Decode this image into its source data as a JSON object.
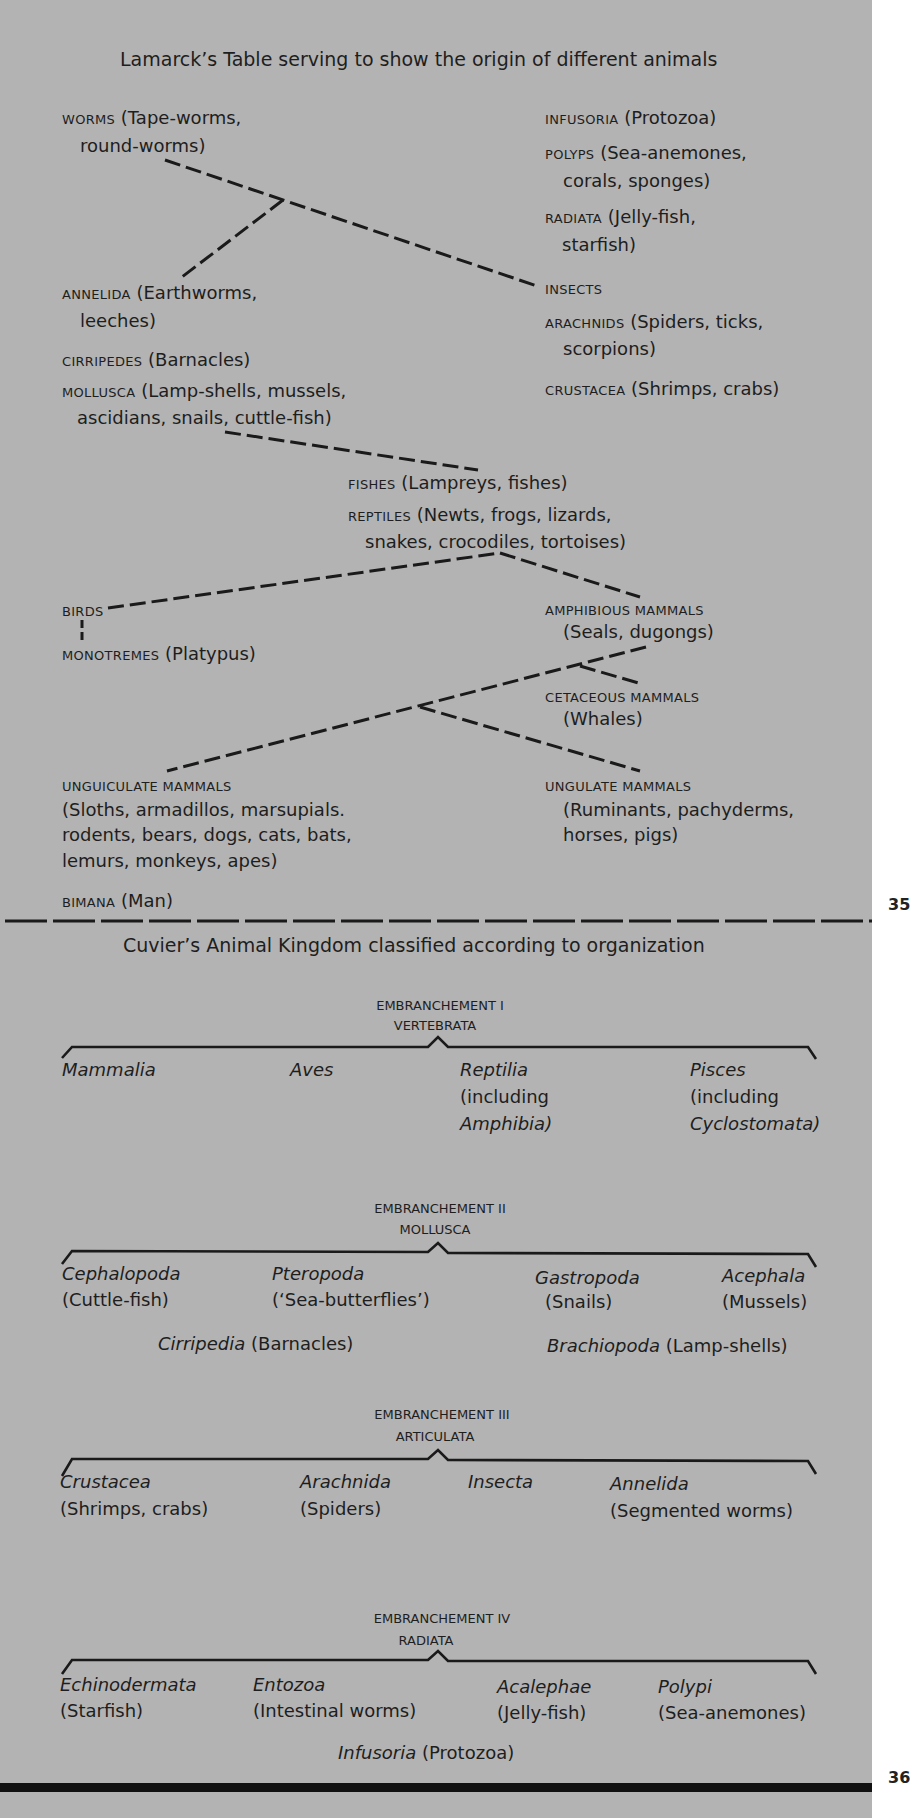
{
  "lamarck": {
    "title": "Lamarck’s Table serving to show the origin of different animals",
    "left_column": [
      {
        "group": "WORMS",
        "desc": "(Tape-worms,",
        "desc2": "round-worms)"
      },
      {
        "group": "ANNELIDA",
        "desc": "(Earthworms,",
        "desc2": "leeches)"
      },
      {
        "group": "CIRRIPEDES",
        "desc": "(Barnacles)"
      },
      {
        "group": "MOLLUSCA",
        "desc": "(Lamp-shells, mussels,",
        "desc2": "ascidians, snails, cuttle-fish)"
      }
    ],
    "right_column": [
      {
        "group": "INFUSORIA",
        "desc": "(Protozoa)"
      },
      {
        "group": "POLYPS",
        "desc": "(Sea-anemones,",
        "desc2": "corals, sponges)"
      },
      {
        "group": "RADIATA",
        "desc": "(Jelly-fish,",
        "desc2": "starfish)"
      },
      {
        "group": "INSECTS"
      },
      {
        "group": "ARACHNIDS",
        "desc": "(Spiders, ticks,",
        "desc2": "scorpions)"
      },
      {
        "group": "CRUSTACEA",
        "desc": "(Shrimps, crabs)"
      }
    ],
    "center": [
      {
        "group": "FISHES",
        "desc": "(Lampreys, fishes)"
      },
      {
        "group": "REPTILES",
        "desc": "(Newts, frogs, lizards,",
        "desc2": "snakes, crocodiles, tortoises)"
      }
    ],
    "lower_left": [
      {
        "group": "BIRDS"
      },
      {
        "group": "MONOTREMES",
        "desc": "(Platypus)"
      },
      {
        "group": "UNGUICULATE MAMMALS",
        "desc": "(Sloths, armadillos, marsupials.",
        "desc2": "rodents, bears, dogs, cats, bats,",
        "desc3": "lemurs, monkeys, apes)"
      },
      {
        "group": "BIMANA",
        "desc": "(Man)"
      }
    ],
    "lower_right": [
      {
        "group": "AMPHIBIOUS MAMMALS",
        "desc": "(Seals, dugongs)"
      },
      {
        "group": "CETACEOUS MAMMALS",
        "desc": "(Whales)"
      },
      {
        "group": "UNGULATE MAMMALS",
        "desc": "(Ruminants, pachyderms,",
        "desc2": "horses, pigs)"
      }
    ],
    "page_number": "35"
  },
  "cuvier": {
    "title": "Cuvier’s Animal Kingdom classified according to organization",
    "embranchements": [
      {
        "label": "EMBRANCHEMENT I",
        "name": "VERTEBRATA",
        "items": [
          {
            "taxon": "Mammalia"
          },
          {
            "taxon": "Aves"
          },
          {
            "taxon": "Reptilia",
            "note": "(including",
            "note_italic": "Amphibia)"
          },
          {
            "taxon": "Pisces",
            "note": "(including",
            "note_italic": "Cyclostomata)"
          }
        ]
      },
      {
        "label": "EMBRANCHEMENT II",
        "name": "MOLLUSCA",
        "items": [
          {
            "taxon": "Cephalopoda",
            "note": "(Cuttle-fish)"
          },
          {
            "taxon": "Pteropoda",
            "note": "(‘Sea-butterflies’)"
          },
          {
            "taxon": "Gastropoda",
            "note": "(Snails)"
          },
          {
            "taxon": "Acephala",
            "note": "(Mussels)"
          }
        ],
        "extra": [
          {
            "taxon": "Cirripedia",
            "note": "(Barnacles)"
          },
          {
            "taxon": "Brachiopoda",
            "note": "(Lamp-shells)"
          }
        ]
      },
      {
        "label": "EMBRANCHEMENT III",
        "name": "ARTICULATA",
        "items": [
          {
            "taxon": "Crustacea",
            "note": "(Shrimps, crabs)"
          },
          {
            "taxon": "Arachnida",
            "note": "(Spiders)"
          },
          {
            "taxon": "Insecta"
          },
          {
            "taxon": "Annelida",
            "note": "(Segmented worms)"
          }
        ]
      },
      {
        "label": "EMBRANCHEMENT IV",
        "name": "RADIATA",
        "items": [
          {
            "taxon": "Echinodermata",
            "note": "(Starfish)"
          },
          {
            "taxon": "Entozoa",
            "note": "(Intestinal worms)"
          },
          {
            "taxon": "Acalephae",
            "note": "(Jelly-fish)"
          },
          {
            "taxon": "Polypi",
            "note": "(Sea-anemones)"
          }
        ],
        "extra": [
          {
            "taxon": "Infusoria",
            "note": "(Protozoa)"
          }
        ]
      }
    ],
    "page_number": "36"
  },
  "colors": {
    "page": "#b3b3b3",
    "ink": "#1e1e1e",
    "margin": "#ffffff"
  }
}
